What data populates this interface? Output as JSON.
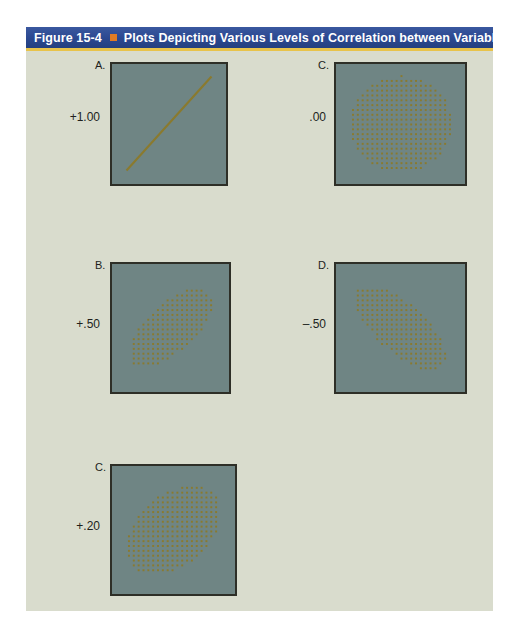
{
  "header": {
    "figure_number": "Figure 15-4",
    "bullet_icon": "orange-square-icon",
    "title": "Plots Depicting Various Levels of Correlation between Variables",
    "bar_color": "#2b4890",
    "rule_color": "#e8c34a",
    "bullet_color": "#e07b23",
    "text_color": "#ffffff"
  },
  "figure": {
    "background_color": "#d9dccd",
    "page_color": "#ffffff",
    "plot_fill_color": "#6f8584",
    "plot_border_color": "#2e2f27",
    "mark_color": "#8a7a2e"
  },
  "chart_data": {
    "type": "scatter",
    "title": "Plots Depicting Various Levels of Correlation between Variables",
    "xlabel": "",
    "ylabel": "",
    "grid": false,
    "legend": "none",
    "xlim": [
      0,
      1
    ],
    "ylim": [
      0,
      1
    ],
    "panels": [
      {
        "letter": "A.",
        "value": "+1.00",
        "correlation": 1.0,
        "shape": "line",
        "description": "Perfect positive correlation shown as a single straight diagonal line from lower-left to upper-right",
        "line_from": [
          0.12,
          0.12
        ],
        "line_to": [
          0.88,
          0.9
        ],
        "position": "top-left"
      },
      {
        "letter": "C.",
        "value": ".00",
        "correlation": 0.0,
        "shape": "circle",
        "description": "No correlation shown as a circular cloud of evenly spaced dots",
        "ellipse_angle_deg": 0,
        "ellipse_rx": 0.4,
        "ellipse_ry": 0.4,
        "position": "top-right"
      },
      {
        "letter": "B.",
        "value": "+.50",
        "correlation": 0.5,
        "shape": "ellipse",
        "description": "Moderate positive correlation shown as an ellipse tilted upward to the right",
        "ellipse_angle_deg": -42,
        "ellipse_rx": 0.44,
        "ellipse_ry": 0.19,
        "position": "middle-left"
      },
      {
        "letter": "D.",
        "value": "–.50",
        "correlation": -0.5,
        "shape": "ellipse",
        "description": "Moderate negative correlation shown as an ellipse tilted downward to the right",
        "ellipse_angle_deg": 42,
        "ellipse_rx": 0.44,
        "ellipse_ry": 0.19,
        "position": "middle-right"
      },
      {
        "letter": "C.",
        "value": "+.20",
        "correlation": 0.2,
        "shape": "ellipse",
        "description": "Weak positive correlation shown as a broad ellipse tilted slightly upward to the right",
        "ellipse_angle_deg": -40,
        "ellipse_rx": 0.44,
        "ellipse_ry": 0.28,
        "position": "bottom-left"
      }
    ]
  }
}
